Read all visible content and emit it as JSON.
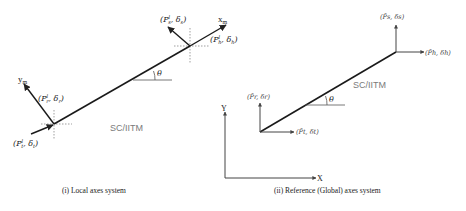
{
  "panels": [
    {
      "id": "local",
      "caption": "(i) Local axes system",
      "member_label": "SC/IITM",
      "angle_label": "θ",
      "axis_labels": {
        "x": "x",
        "x_sub": "m",
        "y": "y",
        "y_sub": "m"
      },
      "nodes": {
        "head": {
          "P": "P",
          "sup": "l",
          "sub_P": "h",
          "delta_sub": "h"
        },
        "head_s": {
          "P": "P",
          "sup": "l",
          "sub_P": "s",
          "delta_sub": "s"
        },
        "tail_r": {
          "P": "P",
          "sup": "l",
          "sub_P": "r",
          "delta_sub": "r"
        },
        "tail_t": {
          "P": "P",
          "sup": "l",
          "sub_P": "t",
          "delta_sub": "t"
        }
      }
    },
    {
      "id": "global",
      "caption": "(ii) Reference (Global) axes system",
      "member_label": "SC/IITM",
      "angle_label": "θ",
      "axis_labels": {
        "x": "X",
        "y": "Y"
      },
      "nodes": {
        "head_h": {
          "label": "(P̄h, δh)"
        },
        "head_s": {
          "label": "(P̄s, δs)"
        },
        "tail_r": {
          "label": "(P̄r, δr)"
        },
        "tail_t": {
          "label": "(P̄t, δt)"
        }
      }
    }
  ],
  "colors": {
    "line": "#1a1a1a",
    "thin": "#555555",
    "dashed": "#777777",
    "member_label": "#7a7a7a",
    "text": "#222222"
  }
}
